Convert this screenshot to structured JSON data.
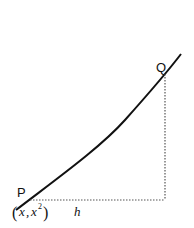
{
  "diagram": {
    "type": "secant-on-curve",
    "curve": "y = x^2",
    "points": {
      "P": {
        "label": "P",
        "coord_label_x": "x",
        "coord_label_y": "x",
        "coord_label_y_exp": "2"
      },
      "Q": {
        "label": "Q"
      }
    },
    "horizontal_segment_label": "h",
    "colors": {
      "curve": "#111111",
      "dotted": "#555555",
      "text": "#111111"
    }
  }
}
